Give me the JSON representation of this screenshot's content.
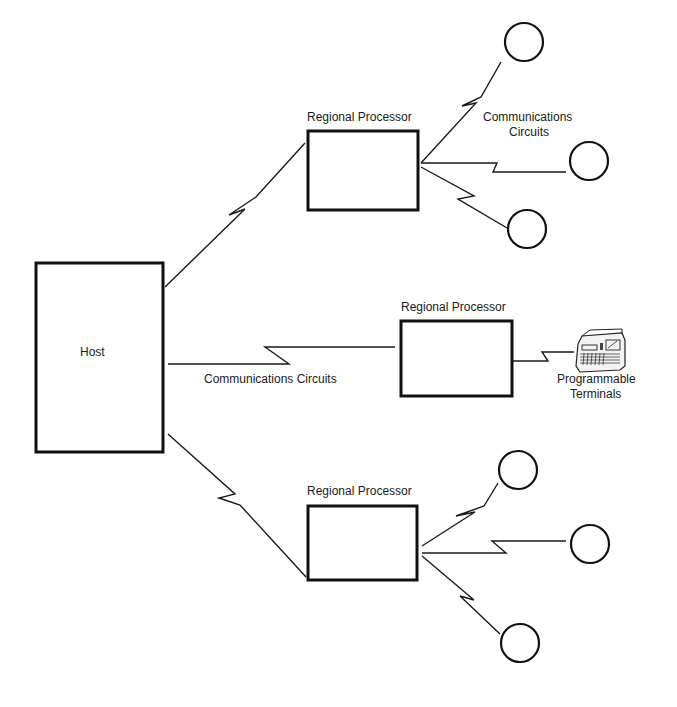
{
  "diagram": {
    "type": "network-topology",
    "host": {
      "label": "Host"
    },
    "regional_processors": [
      {
        "id": "rp-top",
        "label": "Regional Processor",
        "circuit_label_line1": "Communications",
        "circuit_label_line2": "Circuits",
        "terminal_count": 3
      },
      {
        "id": "rp-middle",
        "label": "Regional Processor",
        "host_link_label": "Communications Circuits",
        "terminal_label_line1": "Programmable",
        "terminal_label_line2": "Terminals"
      },
      {
        "id": "rp-bottom",
        "label": "Regional Processor",
        "terminal_count": 3
      }
    ]
  }
}
